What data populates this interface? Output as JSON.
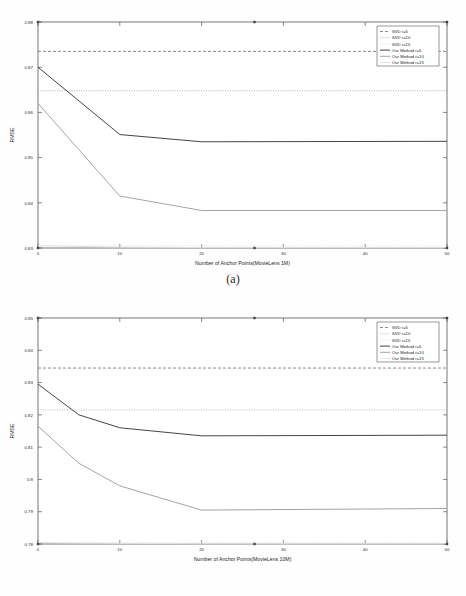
{
  "figure": {
    "panels": [
      {
        "caption": "(a)",
        "chart_data": {
          "type": "line",
          "title": "",
          "xlabel": "Number of Anchor Points(MovieLens 1M)",
          "ylabel": "RMSE",
          "xlim": [
            0,
            50
          ],
          "ylim": [
            0.83,
            0.88
          ],
          "xticks": [
            0,
            10,
            20,
            30,
            40,
            50
          ],
          "xticklabels": [
            "0",
            "10",
            "20",
            "30",
            "40",
            "50"
          ],
          "yticks": [
            0.83,
            0.84,
            0.85,
            0.86,
            0.87,
            0.88
          ],
          "yticklabels": [
            "0.83",
            "0.84",
            "0.85",
            "0.86",
            "0.87",
            "0.88"
          ],
          "grid": false,
          "legend_position": "upper right",
          "series": [
            {
              "name": "SVD r=5",
              "style": "dashed",
              "color": "#5a5a5a",
              "x": [
                0,
                50
              ],
              "values": [
                0.8735,
                0.8735
              ]
            },
            {
              "name": "SVD r=10",
              "style": "dotted",
              "color": "#8c8c8c",
              "x": [
                0,
                50
              ],
              "values": [
                0.8648,
                0.8648
              ]
            },
            {
              "name": "SVD r=15",
              "style": "dotted-faint",
              "color": "#d2d2d2",
              "x": [
                0,
                50
              ],
              "values": [
                0.8305,
                0.8305
              ]
            },
            {
              "name": "Our Method r=5",
              "style": "solid",
              "color": "#3a3a3a",
              "x": [
                0,
                10,
                20,
                50
              ],
              "values": [
                0.87,
                0.8551,
                0.8535,
                0.8536
              ]
            },
            {
              "name": "Our Method r=10",
              "style": "solid",
              "color": "#a0a0a0",
              "x": [
                0,
                10,
                20,
                50
              ],
              "values": [
                0.862,
                0.8415,
                0.8383,
                0.8383
              ]
            },
            {
              "name": "Our Method r=15",
              "style": "solid",
              "color": "#e2e2e2",
              "x": [
                0,
                10,
                20,
                50
              ],
              "values": [
                0.8305,
                0.8302,
                0.8301,
                0.8301
              ]
            }
          ]
        }
      },
      {
        "caption": "(b)",
        "chart_data": {
          "type": "line",
          "title": "",
          "xlabel": "Number of Anchor Points(MovieLens 10M)",
          "ylabel": "RMSE",
          "xlim": [
            0,
            50
          ],
          "ylim": [
            0.78,
            0.85
          ],
          "xticks": [
            0,
            10,
            20,
            30,
            40,
            50
          ],
          "xticklabels": [
            "0",
            "10",
            "20",
            "30",
            "40",
            "50"
          ],
          "yticks": [
            0.78,
            0.79,
            0.8,
            0.81,
            0.82,
            0.83,
            0.84,
            0.85
          ],
          "yticklabels": [
            "0.78",
            "0.79",
            "0.8",
            "0.81",
            "0.82",
            "0.83",
            "0.84",
            "0.85"
          ],
          "grid": false,
          "legend_position": "upper right",
          "series": [
            {
              "name": "SVD r=5",
              "style": "dashed",
              "color": "#5a5a5a",
              "x": [
                0,
                50
              ],
              "values": [
                0.8345,
                0.8345
              ]
            },
            {
              "name": "SVD r=10",
              "style": "dotted",
              "color": "#9a9a9a",
              "x": [
                0,
                50
              ],
              "values": [
                0.8215,
                0.8215
              ]
            },
            {
              "name": "SVD r=15",
              "style": "dotted-faint",
              "color": "#d8d8d8",
              "x": [
                0,
                50
              ],
              "values": [
                0.7805,
                0.7805
              ]
            },
            {
              "name": "Our Method r=5",
              "style": "solid",
              "color": "#3a3a3a",
              "x": [
                0,
                5,
                10,
                20,
                50
              ],
              "values": [
                0.8295,
                0.82,
                0.816,
                0.8135,
                0.8137
              ]
            },
            {
              "name": "Our Method r=10",
              "style": "solid",
              "color": "#9e9e9e",
              "x": [
                0,
                5,
                10,
                20,
                50
              ],
              "values": [
                0.8165,
                0.805,
                0.798,
                0.7905,
                0.791
              ]
            },
            {
              "name": "Our Method r=15",
              "style": "solid",
              "color": "#e4e4e4",
              "x": [
                0,
                5,
                10,
                20,
                50
              ],
              "values": [
                0.7805,
                0.7803,
                0.7802,
                0.7801,
                0.7801
              ]
            }
          ]
        }
      }
    ]
  }
}
